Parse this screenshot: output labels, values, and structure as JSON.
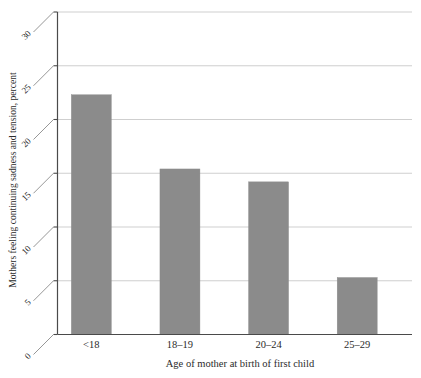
{
  "chart_data": {
    "type": "bar",
    "title": "",
    "subtitle": "",
    "xlabel": "Age of mother at birth of first child",
    "ylabel": "Mothers feeling continuing sadness and tension, percent",
    "categories": [
      "<18",
      "18–19",
      "20–24",
      "25–29"
    ],
    "values": [
      22.3,
      15.4,
      14.2,
      5.3
    ],
    "series": [
      {
        "name": "Mothers feeling continuing sadness and tension, percent",
        "values": [
          22.3,
          15.4,
          14.2,
          5.3
        ]
      }
    ],
    "ylim": [
      0,
      30
    ],
    "ytick_labels": [
      "0",
      "5",
      "10",
      "15",
      "20",
      "25",
      "30"
    ],
    "ytick_values": [
      0,
      5,
      10,
      15,
      20,
      25,
      30
    ],
    "grid": "horizontal",
    "legend": "none",
    "bar_color": "#8b8b8b",
    "gridline_color": "#c9c9c9",
    "axis_color": "#4a4a4a",
    "background_color": "#ffffff",
    "ytick_label_rotation_degrees": -45,
    "annotations": []
  }
}
